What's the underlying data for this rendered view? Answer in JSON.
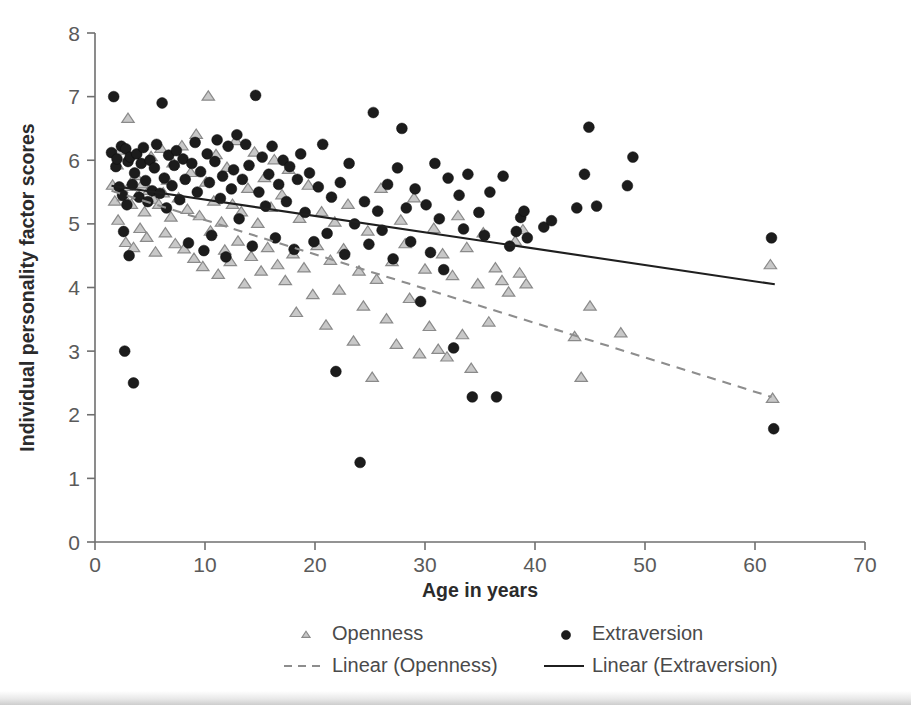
{
  "chart_data": {
    "type": "scatter",
    "title": "",
    "xlabel": "Age in years",
    "ylabel": "Individual personality factor scores",
    "xlim": [
      0,
      70
    ],
    "ylim": [
      0,
      8
    ],
    "xticks": [
      0,
      10,
      20,
      30,
      40,
      50,
      60,
      70
    ],
    "yticks": [
      0,
      1,
      2,
      3,
      4,
      5,
      6,
      7,
      8
    ],
    "grid": false,
    "legend_position": "bottom",
    "legend": [
      {
        "label": "Openness",
        "marker": "triangle",
        "color": "#c8c8c8"
      },
      {
        "label": "Extraversion",
        "marker": "circle",
        "color": "#1c1c1c"
      },
      {
        "label": "Linear (Openness)",
        "marker": "dashed-line",
        "color": "#8d8d8d"
      },
      {
        "label": "Linear (Extraversion)",
        "marker": "solid-line",
        "color": "#1f1f1f"
      }
    ],
    "series": [
      {
        "name": "Openness",
        "marker": "triangle",
        "color": "#c8c8c8",
        "points": [
          [
            1.6,
            5.6
          ],
          [
            1.8,
            5.35
          ],
          [
            2.0,
            5.92
          ],
          [
            2.1,
            5.05
          ],
          [
            2.3,
            6.15
          ],
          [
            2.4,
            5.55
          ],
          [
            2.6,
            5.42
          ],
          [
            2.8,
            4.7
          ],
          [
            3.0,
            6.65
          ],
          [
            3.1,
            5.58
          ],
          [
            3.3,
            5.3
          ],
          [
            3.5,
            4.62
          ],
          [
            3.7,
            5.75
          ],
          [
            3.9,
            5.45
          ],
          [
            4.1,
            4.92
          ],
          [
            4.3,
            5.62
          ],
          [
            4.5,
            5.18
          ],
          [
            4.7,
            4.78
          ],
          [
            4.9,
            5.52
          ],
          [
            5.1,
            6.05
          ],
          [
            5.3,
            5.38
          ],
          [
            5.5,
            4.55
          ],
          [
            5.8,
            5.3
          ],
          [
            6.0,
            6.18
          ],
          [
            6.2,
            5.48
          ],
          [
            6.4,
            4.85
          ],
          [
            6.6,
            5.68
          ],
          [
            6.9,
            5.1
          ],
          [
            7.1,
            5.95
          ],
          [
            7.3,
            4.68
          ],
          [
            7.6,
            5.4
          ],
          [
            7.9,
            6.22
          ],
          [
            8.1,
            4.6
          ],
          [
            8.4,
            5.22
          ],
          [
            8.7,
            5.8
          ],
          [
            9.0,
            4.45
          ],
          [
            9.2,
            6.4
          ],
          [
            9.5,
            5.12
          ],
          [
            9.8,
            4.32
          ],
          [
            10.1,
            5.65
          ],
          [
            10.3,
            7.0
          ],
          [
            10.5,
            4.88
          ],
          [
            10.8,
            5.35
          ],
          [
            11.0,
            6.08
          ],
          [
            11.2,
            4.2
          ],
          [
            11.5,
            5.02
          ],
          [
            11.8,
            4.58
          ],
          [
            12.0,
            5.88
          ],
          [
            12.3,
            4.4
          ],
          [
            12.5,
            5.3
          ],
          [
            12.8,
            6.3
          ],
          [
            13.0,
            4.72
          ],
          [
            13.3,
            5.18
          ],
          [
            13.6,
            4.05
          ],
          [
            13.9,
            5.55
          ],
          [
            14.2,
            4.48
          ],
          [
            14.5,
            6.12
          ],
          [
            14.8,
            5.0
          ],
          [
            15.1,
            4.25
          ],
          [
            15.4,
            5.72
          ],
          [
            15.7,
            4.62
          ],
          [
            16.0,
            5.25
          ],
          [
            16.3,
            6.0
          ],
          [
            16.6,
            4.35
          ],
          [
            17.0,
            5.45
          ],
          [
            17.3,
            4.1
          ],
          [
            17.6,
            5.85
          ],
          [
            18.0,
            4.52
          ],
          [
            18.3,
            3.6
          ],
          [
            18.6,
            5.08
          ],
          [
            19.0,
            4.3
          ],
          [
            19.4,
            5.6
          ],
          [
            19.8,
            3.88
          ],
          [
            20.2,
            4.65
          ],
          [
            20.6,
            5.18
          ],
          [
            21.0,
            3.4
          ],
          [
            21.4,
            4.42
          ],
          [
            21.8,
            5.02
          ],
          [
            22.2,
            3.95
          ],
          [
            22.6,
            4.6
          ],
          [
            23.0,
            5.3
          ],
          [
            23.5,
            3.15
          ],
          [
            24.0,
            4.25
          ],
          [
            24.4,
            3.7
          ],
          [
            24.8,
            4.88
          ],
          [
            25.2,
            2.58
          ],
          [
            25.6,
            4.12
          ],
          [
            26.0,
            5.55
          ],
          [
            26.5,
            3.5
          ],
          [
            27.0,
            4.4
          ],
          [
            27.4,
            3.1
          ],
          [
            27.8,
            5.05
          ],
          [
            28.2,
            4.68
          ],
          [
            28.6,
            3.82
          ],
          [
            29.0,
            5.4
          ],
          [
            29.5,
            2.95
          ],
          [
            30.0,
            4.28
          ],
          [
            30.4,
            3.38
          ],
          [
            30.8,
            4.92
          ],
          [
            31.2,
            3.02
          ],
          [
            31.6,
            4.52
          ],
          [
            32.0,
            2.9
          ],
          [
            32.5,
            4.18
          ],
          [
            33.0,
            5.12
          ],
          [
            33.4,
            3.25
          ],
          [
            33.8,
            4.62
          ],
          [
            34.2,
            2.72
          ],
          [
            34.8,
            4.05
          ],
          [
            35.3,
            4.85
          ],
          [
            35.8,
            3.45
          ],
          [
            36.4,
            4.3
          ],
          [
            37.0,
            4.1
          ],
          [
            37.6,
            3.92
          ],
          [
            38.2,
            4.72
          ],
          [
            38.6,
            4.22
          ],
          [
            38.9,
            4.9
          ],
          [
            39.2,
            4.05
          ],
          [
            43.6,
            3.22
          ],
          [
            44.2,
            2.58
          ],
          [
            45.0,
            3.7
          ],
          [
            47.8,
            3.28
          ],
          [
            61.4,
            4.35
          ],
          [
            61.6,
            2.25
          ]
        ]
      },
      {
        "name": "Extraversion",
        "marker": "circle",
        "color": "#1c1c1c",
        "points": [
          [
            1.5,
            6.12
          ],
          [
            1.7,
            7.0
          ],
          [
            1.9,
            5.9
          ],
          [
            2.0,
            6.02
          ],
          [
            2.2,
            5.58
          ],
          [
            2.4,
            6.22
          ],
          [
            2.5,
            5.45
          ],
          [
            2.6,
            4.88
          ],
          [
            2.7,
            3.0
          ],
          [
            2.8,
            6.18
          ],
          [
            2.9,
            5.3
          ],
          [
            3.0,
            5.98
          ],
          [
            3.1,
            4.5
          ],
          [
            3.2,
            6.05
          ],
          [
            3.4,
            5.62
          ],
          [
            3.5,
            2.5
          ],
          [
            3.6,
            5.8
          ],
          [
            3.8,
            6.1
          ],
          [
            4.0,
            5.42
          ],
          [
            4.2,
            5.95
          ],
          [
            4.4,
            6.2
          ],
          [
            4.6,
            5.68
          ],
          [
            4.8,
            5.35
          ],
          [
            5.0,
            6.0
          ],
          [
            5.2,
            5.52
          ],
          [
            5.4,
            5.88
          ],
          [
            5.6,
            6.25
          ],
          [
            5.9,
            5.48
          ],
          [
            6.1,
            6.9
          ],
          [
            6.3,
            5.72
          ],
          [
            6.5,
            5.25
          ],
          [
            6.7,
            6.08
          ],
          [
            7.0,
            5.6
          ],
          [
            7.2,
            5.92
          ],
          [
            7.4,
            6.15
          ],
          [
            7.7,
            5.38
          ],
          [
            8.0,
            6.02
          ],
          [
            8.2,
            5.7
          ],
          [
            8.5,
            4.7
          ],
          [
            8.8,
            5.95
          ],
          [
            9.1,
            6.28
          ],
          [
            9.3,
            5.5
          ],
          [
            9.6,
            5.82
          ],
          [
            9.9,
            4.58
          ],
          [
            10.2,
            6.1
          ],
          [
            10.4,
            5.65
          ],
          [
            10.6,
            4.82
          ],
          [
            10.9,
            5.98
          ],
          [
            11.1,
            6.32
          ],
          [
            11.4,
            5.4
          ],
          [
            11.6,
            5.75
          ],
          [
            11.9,
            4.48
          ],
          [
            12.1,
            6.22
          ],
          [
            12.4,
            5.55
          ],
          [
            12.6,
            5.85
          ],
          [
            12.9,
            6.4
          ],
          [
            13.1,
            5.08
          ],
          [
            13.4,
            5.7
          ],
          [
            13.7,
            6.25
          ],
          [
            14.0,
            5.92
          ],
          [
            14.3,
            4.65
          ],
          [
            14.6,
            7.02
          ],
          [
            14.9,
            5.5
          ],
          [
            15.2,
            6.05
          ],
          [
            15.5,
            5.28
          ],
          [
            15.8,
            5.78
          ],
          [
            16.1,
            6.22
          ],
          [
            16.4,
            4.78
          ],
          [
            16.7,
            5.62
          ],
          [
            17.1,
            6.0
          ],
          [
            17.4,
            5.35
          ],
          [
            17.7,
            5.9
          ],
          [
            18.1,
            4.6
          ],
          [
            18.4,
            5.7
          ],
          [
            18.7,
            6.1
          ],
          [
            19.1,
            5.18
          ],
          [
            19.5,
            5.8
          ],
          [
            19.9,
            4.72
          ],
          [
            20.3,
            5.58
          ],
          [
            20.7,
            6.25
          ],
          [
            21.1,
            4.85
          ],
          [
            21.5,
            5.42
          ],
          [
            21.9,
            2.68
          ],
          [
            22.3,
            5.65
          ],
          [
            22.7,
            4.52
          ],
          [
            23.1,
            5.95
          ],
          [
            23.6,
            5.0
          ],
          [
            24.1,
            1.25
          ],
          [
            24.5,
            5.35
          ],
          [
            24.9,
            4.68
          ],
          [
            25.3,
            6.75
          ],
          [
            25.7,
            5.2
          ],
          [
            26.1,
            4.9
          ],
          [
            26.6,
            5.62
          ],
          [
            27.1,
            4.45
          ],
          [
            27.5,
            5.88
          ],
          [
            27.9,
            6.5
          ],
          [
            28.3,
            5.25
          ],
          [
            28.7,
            4.72
          ],
          [
            29.1,
            5.55
          ],
          [
            29.6,
            3.78
          ],
          [
            30.1,
            5.3
          ],
          [
            30.5,
            4.55
          ],
          [
            30.9,
            5.95
          ],
          [
            31.3,
            5.08
          ],
          [
            31.7,
            4.28
          ],
          [
            32.1,
            5.72
          ],
          [
            32.6,
            3.05
          ],
          [
            33.1,
            5.45
          ],
          [
            33.5,
            4.92
          ],
          [
            33.9,
            5.78
          ],
          [
            34.3,
            2.28
          ],
          [
            34.9,
            5.18
          ],
          [
            35.4,
            4.82
          ],
          [
            35.9,
            5.5
          ],
          [
            36.5,
            2.28
          ],
          [
            37.1,
            5.75
          ],
          [
            37.7,
            4.65
          ],
          [
            38.3,
            4.88
          ],
          [
            38.7,
            5.1
          ],
          [
            39.0,
            5.2
          ],
          [
            39.3,
            4.78
          ],
          [
            40.8,
            4.95
          ],
          [
            41.5,
            5.05
          ],
          [
            43.8,
            5.25
          ],
          [
            44.5,
            5.78
          ],
          [
            44.9,
            6.52
          ],
          [
            45.6,
            5.28
          ],
          [
            48.4,
            5.6
          ],
          [
            48.9,
            6.05
          ],
          [
            61.5,
            4.78
          ],
          [
            61.7,
            1.78
          ]
        ]
      }
    ],
    "trendlines": [
      {
        "name": "Linear (Openness)",
        "style": "dashed",
        "color": "#8d8d8d",
        "x_start": 1.5,
        "y_start": 5.52,
        "x_end": 61.5,
        "y_end": 2.28
      },
      {
        "name": "Linear (Extraversion)",
        "style": "solid",
        "color": "#1f1f1f",
        "x_start": 1.5,
        "y_start": 5.6,
        "x_end": 61.8,
        "y_end": 4.05
      }
    ]
  }
}
